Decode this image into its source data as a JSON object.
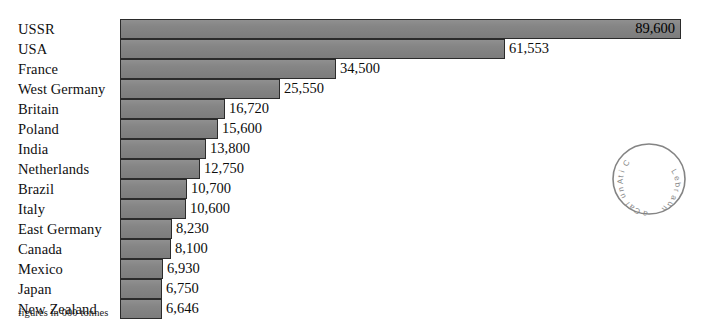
{
  "chart_data": {
    "type": "bar",
    "orientation": "horizontal",
    "title": "",
    "subtitle": "",
    "xlabel": "",
    "ylabel": "",
    "footnote": "figures in 000 tonnes",
    "units": "000 tonnes",
    "grid": false,
    "legend": false,
    "xlim": [
      0,
      89600
    ],
    "categories": [
      "USSR",
      "USA",
      "France",
      "West Germany",
      "Britain",
      "Poland",
      "India",
      "Netherlands",
      "Brazil",
      "Italy",
      "East Germany",
      "Canada",
      "Mexico",
      "Japan",
      "New Zealand"
    ],
    "values": [
      89600,
      61553,
      34500,
      25550,
      16720,
      15600,
      13800,
      12750,
      10700,
      10600,
      8230,
      8100,
      6930,
      6750,
      6646
    ],
    "value_labels": [
      "89,600",
      "61,553",
      "34,500",
      "25,550",
      "16,720",
      "15,600",
      "13,800",
      "12,750",
      "10,700",
      "10,600",
      "8,230",
      "8,100",
      "6,930",
      "6,750",
      "6,646"
    ],
    "label_placement": [
      "inside",
      "outside",
      "outside",
      "outside",
      "outside",
      "outside",
      "outside",
      "outside",
      "outside",
      "outside",
      "outside",
      "outside",
      "outside",
      "outside",
      "outside"
    ],
    "colors": {
      "bar_fill": "#838383",
      "bar_stroke": "#2b2b2b",
      "text": "#101010",
      "background": "#ffffff"
    }
  },
  "stamp": {
    "name": "library-stamp",
    "shape": "circle",
    "legible": false
  }
}
